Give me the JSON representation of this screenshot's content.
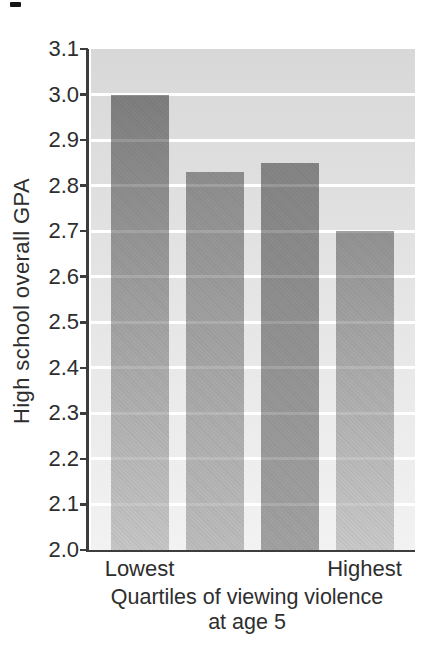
{
  "chart_data": {
    "type": "bar",
    "title": "",
    "ylabel": "High school overall GPA",
    "xlabel": "Quartiles of viewing violence at age 5",
    "xlabel_line1": "Quartiles of viewing violence",
    "xlabel_line2": "at age 5",
    "categories": [
      "Lowest",
      "",
      "",
      "Highest"
    ],
    "values": [
      3.0,
      2.83,
      2.85,
      2.7
    ],
    "ylim": [
      2.0,
      3.1
    ],
    "ytick_step": 0.1,
    "ytick_labels": [
      "3.1",
      "3.0",
      "2.9",
      "2.8",
      "2.7",
      "2.6",
      "2.5",
      "2.4",
      "2.3",
      "2.2",
      "2.1",
      "2.0"
    ],
    "grid": "horizontal white lines at each 0.1 interval, drawn behind bars",
    "legend": "none"
  },
  "colors": {
    "page_background": "#ffffff",
    "plot_bg_top": "#d8d8d8",
    "plot_bg_bottom": "#f2f2f2",
    "gridline": "#ffffff",
    "axis": "#3d3d3d",
    "text": "#2e2e2e",
    "artifact_mark": "#161616",
    "bars": [
      {
        "top": "#7e7e7e",
        "bottom": "#c6c6c6"
      },
      {
        "top": "#8d8d8d",
        "bottom": "#bdbdbd"
      },
      {
        "top": "#848484",
        "bottom": "#a2a2a2"
      },
      {
        "top": "#929292",
        "bottom": "#c9c9c9"
      }
    ]
  }
}
